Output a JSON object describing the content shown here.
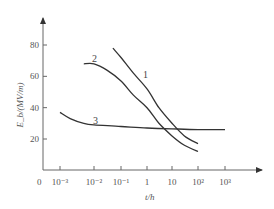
{
  "chart_data": {
    "type": "line",
    "title": "",
    "xlabel": "t/h",
    "ylabel": "E_b/(MV/m)",
    "xscale": "log",
    "x_tick_labels": [
      "0",
      "10⁻³",
      "10⁻²",
      "10⁻¹",
      "1",
      "10",
      "10²",
      "10³"
    ],
    "y_tick_labels": [
      "20",
      "40",
      "60",
      "80"
    ],
    "ylim": [
      0,
      95
    ],
    "xlim": [
      0.0005,
      10000
    ],
    "grid": false,
    "legend": "inline curve labels",
    "series": [
      {
        "name": "1",
        "x": [
          0.05,
          0.1,
          0.3,
          1,
          3,
          10,
          30,
          100
        ],
        "y": [
          78,
          72,
          62,
          52,
          40,
          30,
          22,
          17
        ]
      },
      {
        "name": "2",
        "x": [
          0.005,
          0.01,
          0.03,
          0.1,
          0.3,
          1,
          3,
          10,
          30,
          100
        ],
        "y": [
          68,
          68,
          64,
          57,
          48,
          40,
          30,
          22,
          16,
          12
        ]
      },
      {
        "name": "3",
        "x": [
          0.001,
          0.002,
          0.005,
          0.01,
          0.1,
          1,
          10,
          100,
          1000
        ],
        "y": [
          37,
          33,
          30,
          29,
          28,
          27,
          26.5,
          26,
          26
        ]
      }
    ]
  },
  "labels": {
    "x_axis_title": "t/h",
    "y_axis_title": "E_b/(MV/m)",
    "origin": "0",
    "curve_1": "1",
    "curve_2": "2",
    "curve_3": "3"
  }
}
